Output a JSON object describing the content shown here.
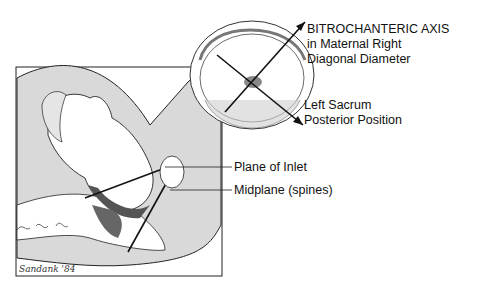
{
  "figure": {
    "labels": {
      "bitrochanteric": [
        "BITROCHANTERIC AXIS",
        "in Maternal Right",
        "Diagonal Diameter"
      ],
      "position": [
        "Left Sacrum",
        "Posterior Position"
      ],
      "plane_of_inlet": "Plane of Inlet",
      "midplane": "Midplane (spines)"
    },
    "signature": "Sandank '84"
  },
  "colors": {
    "background": "#ffffff",
    "uterus_fill": "#d9d9d9",
    "line": "#111111",
    "body_fill": "#ffffff"
  }
}
